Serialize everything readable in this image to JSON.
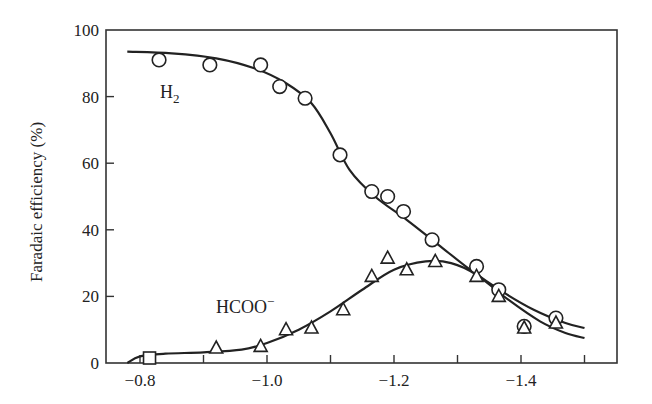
{
  "chart_data": {
    "type": "scatter",
    "title": "",
    "xlabel": "",
    "ylabel": "Faradaic efficiency (%)",
    "xlim": [
      -0.75,
      -1.55
    ],
    "ylim": [
      0,
      100
    ],
    "x_ticks": [
      -0.8,
      -0.9,
      -1.0,
      -1.1,
      -1.2,
      -1.3,
      -1.4,
      -1.5
    ],
    "x_tick_labels": [
      "−0.8",
      "",
      "−1.0",
      "",
      "−1.2",
      "",
      "−1.4",
      ""
    ],
    "y_ticks": [
      0,
      20,
      40,
      60,
      80,
      100
    ],
    "y_tick_labels": [
      "0",
      "20",
      "40",
      "60",
      "80",
      "100"
    ],
    "grid": false,
    "legend": "inline labels",
    "series": [
      {
        "name": "H2",
        "label_text": "H",
        "label_sub": "2",
        "marker": "circle",
        "points": [
          {
            "x": -0.83,
            "y": 91.0
          },
          {
            "x": -0.91,
            "y": 89.5
          },
          {
            "x": -0.99,
            "y": 89.5
          },
          {
            "x": -1.02,
            "y": 83.0
          },
          {
            "x": -1.06,
            "y": 79.5
          },
          {
            "x": -1.115,
            "y": 62.5
          },
          {
            "x": -1.165,
            "y": 51.5
          },
          {
            "x": -1.19,
            "y": 50.0
          },
          {
            "x": -1.215,
            "y": 45.5
          },
          {
            "x": -1.26,
            "y": 37.0
          },
          {
            "x": -1.33,
            "y": 29.0
          },
          {
            "x": -1.365,
            "y": 22.0
          },
          {
            "x": -1.405,
            "y": 11.0
          },
          {
            "x": -1.455,
            "y": 13.5
          }
        ],
        "fit_curve": [
          {
            "x": -0.78,
            "y": 93.5
          },
          {
            "x": -0.85,
            "y": 93.0
          },
          {
            "x": -0.92,
            "y": 91.5
          },
          {
            "x": -0.98,
            "y": 88.5
          },
          {
            "x": -1.03,
            "y": 84.0
          },
          {
            "x": -1.07,
            "y": 78.0
          },
          {
            "x": -1.1,
            "y": 69.0
          },
          {
            "x": -1.13,
            "y": 58.0
          },
          {
            "x": -1.17,
            "y": 50.0
          },
          {
            "x": -1.22,
            "y": 43.0
          },
          {
            "x": -1.27,
            "y": 35.5
          },
          {
            "x": -1.32,
            "y": 28.0
          },
          {
            "x": -1.37,
            "y": 21.5
          },
          {
            "x": -1.42,
            "y": 16.0
          },
          {
            "x": -1.47,
            "y": 12.0
          },
          {
            "x": -1.5,
            "y": 10.5
          }
        ]
      },
      {
        "name": "HCOO-",
        "label_text": "HCOO",
        "label_sup": "−",
        "marker": "triangle",
        "points": [
          {
            "x": -0.92,
            "y": 4.5
          },
          {
            "x": -0.99,
            "y": 5.0
          },
          {
            "x": -1.03,
            "y": 10.0
          },
          {
            "x": -1.07,
            "y": 10.5
          },
          {
            "x": -1.12,
            "y": 16.0
          },
          {
            "x": -1.165,
            "y": 26.0
          },
          {
            "x": -1.19,
            "y": 31.5
          },
          {
            "x": -1.22,
            "y": 28.0
          },
          {
            "x": -1.265,
            "y": 30.5
          },
          {
            "x": -1.33,
            "y": 26.0
          },
          {
            "x": -1.365,
            "y": 20.0
          },
          {
            "x": -1.405,
            "y": 10.5
          },
          {
            "x": -1.455,
            "y": 12.0
          }
        ],
        "extra_points": [
          {
            "x": -0.815,
            "y": 1.5,
            "marker": "square"
          }
        ],
        "fit_curve": [
          {
            "x": -0.78,
            "y": 0.0
          },
          {
            "x": -0.8,
            "y": 2.0
          },
          {
            "x": -0.84,
            "y": 2.8
          },
          {
            "x": -0.9,
            "y": 3.2
          },
          {
            "x": -0.96,
            "y": 4.0
          },
          {
            "x": -1.0,
            "y": 6.0
          },
          {
            "x": -1.05,
            "y": 10.0
          },
          {
            "x": -1.1,
            "y": 15.5
          },
          {
            "x": -1.15,
            "y": 22.0
          },
          {
            "x": -1.2,
            "y": 28.0
          },
          {
            "x": -1.25,
            "y": 30.5
          },
          {
            "x": -1.29,
            "y": 30.0
          },
          {
            "x": -1.33,
            "y": 26.5
          },
          {
            "x": -1.38,
            "y": 19.0
          },
          {
            "x": -1.43,
            "y": 12.5
          },
          {
            "x": -1.47,
            "y": 9.0
          },
          {
            "x": -1.5,
            "y": 7.5
          }
        ]
      }
    ]
  }
}
